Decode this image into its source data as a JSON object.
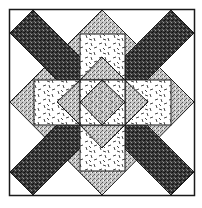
{
  "diagram": {
    "type": "quilt-block",
    "colors": {
      "background": "#ffffff",
      "outline": "#1a1a1a",
      "dark_fabric": "#2a2a2a",
      "stipple_fabric": "#9a9a9a",
      "confetti_fabric": "#ffffff"
    },
    "regions": [
      {
        "name": "outer-frame",
        "fabric": "plain"
      },
      {
        "name": "diagonal-bar-top-left",
        "fabric": "dark"
      },
      {
        "name": "diagonal-bar-top-right",
        "fabric": "dark"
      },
      {
        "name": "diagonal-bar-bottom-left",
        "fabric": "dark"
      },
      {
        "name": "diagonal-bar-bottom-right",
        "fabric": "dark"
      },
      {
        "name": "square-top",
        "fabric": "confetti"
      },
      {
        "name": "square-left",
        "fabric": "confetti"
      },
      {
        "name": "square-right",
        "fabric": "confetti"
      },
      {
        "name": "square-bottom",
        "fabric": "confetti"
      },
      {
        "name": "center-diamond",
        "fabric": "stipple"
      }
    ]
  }
}
